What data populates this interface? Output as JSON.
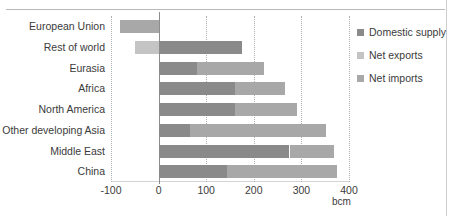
{
  "chart_data": {
    "type": "bar",
    "orientation": "horizontal",
    "stacked": true,
    "title": "",
    "xlabel": "bcm",
    "ylabel": "",
    "xlim": [
      -100,
      400
    ],
    "xticks": [
      -100,
      0,
      100,
      200,
      300,
      400
    ],
    "xtick_labels": [
      "-100",
      "0",
      "100",
      "200",
      "300",
      "400"
    ],
    "grid": true,
    "grid_axis": "x",
    "legend_position": "right",
    "categories": [
      "European Union",
      "Rest of world",
      "Eurasia",
      "Africa",
      "North America",
      "Other developing Asia",
      "Middle East",
      "China"
    ],
    "series": [
      {
        "name": "Domestic supply",
        "color": "#8a8a8a",
        "values": [
          0,
          175,
          80,
          160,
          160,
          65,
          275,
          143
        ]
      },
      {
        "name": "Net exports",
        "color": "#c4c4c4",
        "values": [
          0,
          -50,
          0,
          0,
          0,
          0,
          0,
          0
        ]
      },
      {
        "name": "Net imports",
        "color": "#a8a8a8",
        "values": [
          -82,
          0,
          142,
          105,
          130,
          287,
          93,
          232
        ]
      }
    ],
    "legend": [
      {
        "label": "Domestic supply",
        "color": "#8a8a8a"
      },
      {
        "label": "Net exports",
        "color": "#c4c4c4"
      },
      {
        "label": "Net imports",
        "color": "#a8a8a8"
      }
    ]
  }
}
